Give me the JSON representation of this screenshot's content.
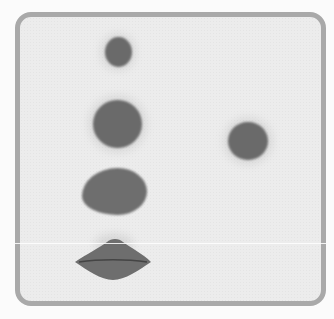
{
  "image": {
    "description": "Grey rounded-rectangle plate with five dark spots",
    "plate": {
      "border_color": "#a9a9a9",
      "fill_color": "#ececec"
    },
    "spot_color": "#6a6a6a",
    "spots": [
      {
        "name": "spot-1-small-oval",
        "cx": 118,
        "cy": 52,
        "w": 27,
        "h": 30
      },
      {
        "name": "spot-2-round",
        "cx": 117,
        "cy": 124,
        "w": 49,
        "h": 48
      },
      {
        "name": "spot-3-teardrop",
        "cx": 115,
        "cy": 191,
        "w": 65,
        "h": 47
      },
      {
        "name": "spot-4-lip-shape",
        "cx": 112,
        "cy": 259,
        "w": 75,
        "h": 42
      },
      {
        "name": "spot-5-round-right",
        "cx": 248,
        "cy": 141,
        "w": 40,
        "h": 38
      }
    ]
  }
}
